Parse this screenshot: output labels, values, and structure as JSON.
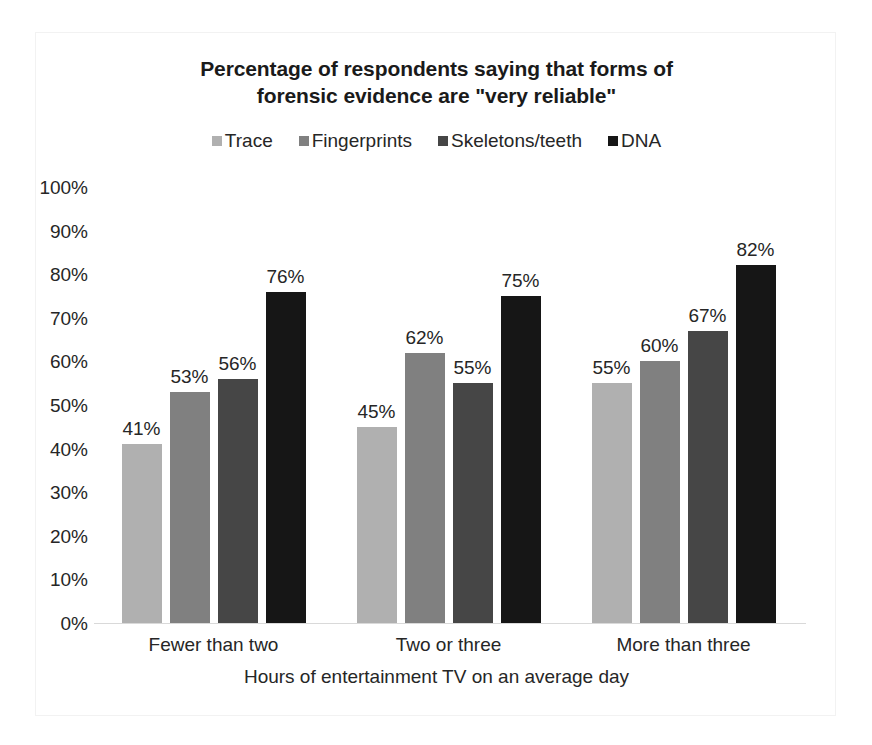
{
  "chart_data": {
    "type": "bar",
    "title": "Percentage of respondents saying that forms of forensic evidence are \"very reliable\"",
    "title_lines": [
      "Percentage of respondents saying that forms of",
      "forensic evidence are \"very reliable\""
    ],
    "xlabel": "Hours of entertainment TV on an average day",
    "ylabel": "",
    "ylim": [
      0,
      100
    ],
    "ytick_step": 10,
    "grid": false,
    "legend_position": "top",
    "value_suffix": "%",
    "categories": [
      "Fewer than two",
      "Two or three",
      "More than three"
    ],
    "series": [
      {
        "name": "Trace",
        "color": "#b0b0b0",
        "values": [
          41,
          45,
          55
        ]
      },
      {
        "name": "Fingerprints",
        "color": "#808080",
        "values": [
          53,
          62,
          60
        ]
      },
      {
        "name": "Skeletons/teeth",
        "color": "#464646",
        "values": [
          56,
          55,
          67
        ]
      },
      {
        "name": "DNA",
        "color": "#161616",
        "values": [
          76,
          75,
          82
        ]
      }
    ],
    "ytick_labels": [
      "100%",
      "90%",
      "80%",
      "70%",
      "60%",
      "50%",
      "40%",
      "30%",
      "20%",
      "10%",
      "0%"
    ],
    "data_labels": {
      "Fewer than two": [
        "41%",
        "53%",
        "56%",
        "76%"
      ],
      "Two or three": [
        "45%",
        "62%",
        "55%",
        "75%"
      ],
      "More than three": [
        "55%",
        "60%",
        "67%",
        "82%"
      ]
    }
  }
}
